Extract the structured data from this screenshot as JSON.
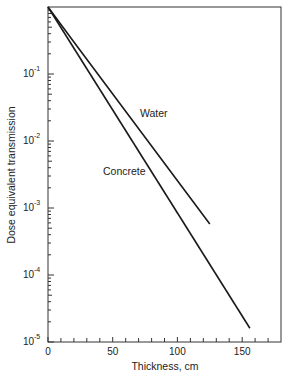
{
  "chart_data": {
    "type": "line",
    "title": "",
    "xlabel": "Thickness,  cm",
    "ylabel": "Dose equivalent transmission",
    "xlim": [
      0,
      180
    ],
    "ylim": [
      1e-05,
      1
    ],
    "yscale": "log",
    "x_ticks": [
      0,
      50,
      100,
      150
    ],
    "x_minor_tick_step": 10,
    "y_ticks": [
      {
        "value": 0.1,
        "base": "10",
        "exp": "-1"
      },
      {
        "value": 0.01,
        "base": "10",
        "exp": "-2"
      },
      {
        "value": 0.001,
        "base": "10",
        "exp": "-3"
      },
      {
        "value": 0.0001,
        "base": "10",
        "exp": "-4"
      },
      {
        "value": 1e-05,
        "base": "10",
        "exp": "-5"
      }
    ],
    "grid": false,
    "legend": "inline labels",
    "series": [
      {
        "name": "Water",
        "x": [
          0,
          20,
          125
        ],
        "y": [
          1.0,
          0.3,
          0.00058
        ]
      },
      {
        "name": "Concrete",
        "x": [
          0,
          156
        ],
        "y": [
          1.0,
          1.6e-05
        ]
      }
    ],
    "annotations": [
      {
        "text": "Water",
        "x": 72,
        "y": 0.022
      },
      {
        "text": "Concrete",
        "x": 43,
        "y": 0.0032
      }
    ]
  },
  "labels": {
    "x_axis_title": "Thickness,  cm",
    "y_axis_title": "Dose equivalent transmission",
    "x_tick_0": "0",
    "x_tick_50": "50",
    "x_tick_100": "100",
    "x_tick_150": "150",
    "y_base": "10",
    "y_exp_1": "-1",
    "y_exp_2": "-2",
    "y_exp_3": "-3",
    "y_exp_4": "-4",
    "y_exp_5": "-5",
    "series_water": "Water",
    "series_concrete": "Concrete"
  },
  "colors": {
    "line": "#1a1a1a",
    "background": "#ffffff"
  }
}
